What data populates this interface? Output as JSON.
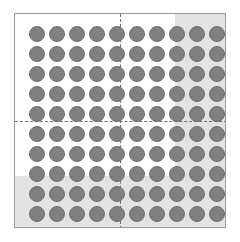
{
  "figure": {
    "title": "",
    "background_color": "#ffffff",
    "frame": {
      "border_color": "#9a9a9a",
      "fill_color": "#ffffff"
    }
  },
  "chart_data": {
    "type": "scatter",
    "title": "",
    "subtitle": "",
    "xlabel": "",
    "ylabel": "",
    "grid": false,
    "legend": null,
    "marker": {
      "shape": "circle",
      "fill_color": "#808080",
      "edge_color": "#6d6d6d",
      "diameter_px": 16
    },
    "grid_layout": {
      "columns": 10,
      "rows": 10,
      "total_points": 100,
      "x_pitch_px": 20,
      "y_pitch_px": 20,
      "x_start_px": 14,
      "y_start_px": 12
    },
    "x": [
      1,
      2,
      3,
      4,
      5,
      6,
      7,
      8,
      9,
      10
    ],
    "y": [
      1,
      2,
      3,
      4,
      5,
      6,
      7,
      8,
      9,
      10
    ],
    "xlim": [
      0,
      11
    ],
    "ylim": [
      0,
      11
    ],
    "quadrants": {
      "divider_style": "dashed",
      "divider_color": "#6e6e6e",
      "vertical_divider_x": 5.5,
      "horizontal_divider_y": 5.5,
      "counts": {
        "top_left": 25,
        "top_right": 25,
        "bottom_left": 25,
        "bottom_right": 25
      }
    },
    "shaded_region": {
      "shape": "L",
      "fill_color": "#e3e3e3",
      "columns": [
        8,
        9,
        10
      ],
      "rows": [
        9,
        10
      ],
      "shaded_point_count": 44,
      "unshaded_point_count": 56
    }
  }
}
